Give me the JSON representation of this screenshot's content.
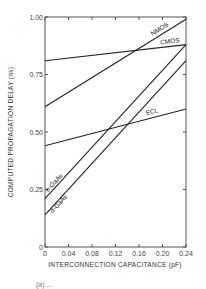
{
  "chart_data": {
    "type": "line",
    "title": "",
    "xlabel": "INTERCONNECTION CAPACITANCE (pF)",
    "ylabel": "COMPUTED PROPAGATION DELAY (ns)",
    "xlim": [
      0,
      0.24
    ],
    "ylim": [
      0,
      1.0
    ],
    "xticks": [
      "0",
      "0.04",
      "0.08",
      "0.12",
      "0.16",
      "0.20",
      "0.24"
    ],
    "yticks": [
      "0",
      "0.25",
      "0.50",
      "0.75",
      "1.00"
    ],
    "grid": false,
    "legend": "inline labels",
    "x": [
      0,
      0.24
    ],
    "series": [
      {
        "name": "NMOS",
        "values": [
          0.61,
          0.99
        ]
      },
      {
        "name": "CMOS",
        "values": [
          0.81,
          0.88
        ]
      },
      {
        "name": "ECL",
        "values": [
          0.44,
          0.6
        ]
      },
      {
        "name": "e-GaAs",
        "values": [
          0.21,
          0.88
        ]
      },
      {
        "name": "d-GaAs",
        "values": [
          0.14,
          0.81
        ]
      }
    ],
    "caption": "(a) ..."
  }
}
